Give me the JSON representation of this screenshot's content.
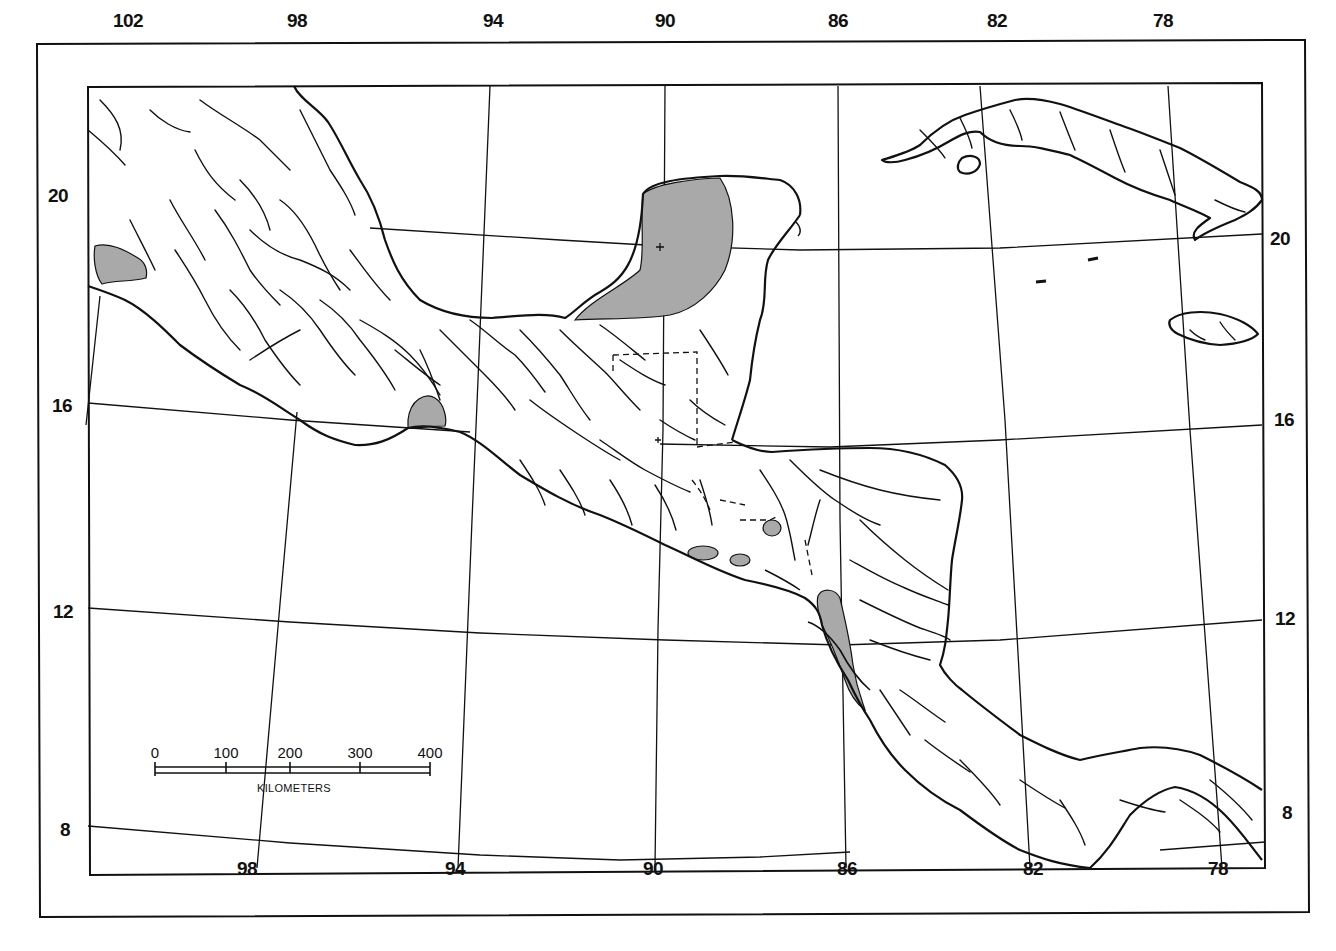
{
  "map": {
    "title": "",
    "region": "Central America and the Caribbean",
    "colors": {
      "ink": "#111111",
      "shade": "#a9a9a9",
      "background": "#ffffff"
    },
    "top_longitude_labels": [
      {
        "text": "102",
        "x": 128,
        "y": 10
      },
      {
        "text": "98",
        "x": 297,
        "y": 10
      },
      {
        "text": "94",
        "x": 493,
        "y": 10
      },
      {
        "text": "90",
        "x": 665,
        "y": 10
      },
      {
        "text": "86",
        "x": 838,
        "y": 10
      },
      {
        "text": "82",
        "x": 997,
        "y": 10
      },
      {
        "text": "78",
        "x": 1163,
        "y": 10
      }
    ],
    "bottom_longitude_labels": [
      {
        "text": "98",
        "x": 247,
        "y": 858
      },
      {
        "text": "94",
        "x": 455,
        "y": 858
      },
      {
        "text": "90",
        "x": 653,
        "y": 858
      },
      {
        "text": "86",
        "x": 847,
        "y": 858
      },
      {
        "text": "82",
        "x": 1033,
        "y": 858
      },
      {
        "text": "78",
        "x": 1218,
        "y": 858
      }
    ],
    "left_latitude_labels": [
      {
        "text": "20",
        "x": 48,
        "y": 196
      },
      {
        "text": "16",
        "x": 52,
        "y": 406
      },
      {
        "text": "12",
        "x": 53,
        "y": 612
      },
      {
        "text": "8",
        "x": 60,
        "y": 830
      }
    ],
    "right_latitude_labels": [
      {
        "text": "20",
        "x": 1270,
        "y": 239
      },
      {
        "text": "16",
        "x": 1274,
        "y": 420
      },
      {
        "text": "12",
        "x": 1275,
        "y": 619
      },
      {
        "text": "8",
        "x": 1282,
        "y": 813
      }
    ],
    "scale_bar": {
      "ticks": [
        "0",
        "100",
        "200",
        "300",
        "400"
      ],
      "unit": "KILOMETERS"
    }
  }
}
